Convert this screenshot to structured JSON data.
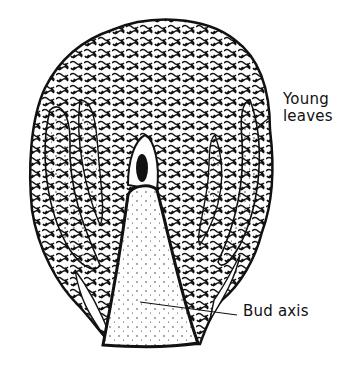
{
  "figure": {
    "colors": {
      "ink": "#111111",
      "background": "#ffffff"
    }
  },
  "labels": {
    "young_leaves_line1": "Young",
    "young_leaves_line2": "leaves",
    "bud_axis": "Bud axis"
  }
}
